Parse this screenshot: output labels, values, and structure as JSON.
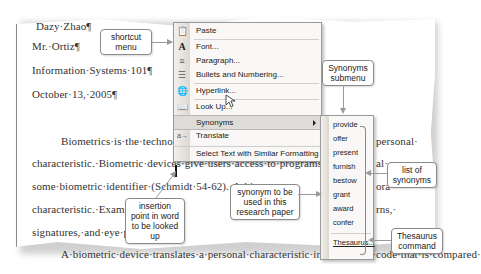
{
  "document": {
    "lines": [
      "Dazy·Zhao¶",
      "Mr.·Ortiz¶",
      "Information·Systems·101¶",
      "October·13,·2005¶",
      "Biometrics·is·the·technology·",
      "characteristic.·Biometric·devices·give·users·access·to·programs,·system",
      "some·biometric·identifier·(Schmidt·54-62).·A·biom",
      "characteristic.·Examples",
      "signatures,·and·eye·patt",
      "A·biometric·device·translates·a·personal·characteristic·into·a·digital·code·that·is·compared·"
    ],
    "right_fragments": [
      "personal·",
      "al·",
      "ora",
      "rns,·"
    ]
  },
  "shortcut_menu": {
    "items": [
      {
        "label": "Paste",
        "icon": "paste-icon"
      },
      {
        "label": "Font...",
        "icon": "font-icon"
      },
      {
        "label": "Paragraph...",
        "icon": "paragraph-icon"
      },
      {
        "label": "Bullets and Numbering...",
        "icon": "bullets-icon"
      },
      {
        "label": "Hyperlink...",
        "icon": "hyperlink-icon"
      },
      {
        "label": "Look Up...",
        "icon": "lookup-icon"
      },
      {
        "label": "Synonyms",
        "icon": "",
        "submenu": true,
        "highlighted": true
      },
      {
        "label": "Translate",
        "icon": "translate-icon"
      },
      {
        "label": "Select Text with Similar Formatting",
        "icon": ""
      }
    ]
  },
  "synonyms_submenu": {
    "items": [
      "provide",
      "offer",
      "present",
      "furnish",
      "bestow",
      "grant",
      "award",
      "confer"
    ],
    "thesaurus_label": "Thesaurus..."
  },
  "callouts": {
    "shortcut_menu": "shortcut menu",
    "synonyms_submenu": "Synonyms submenu",
    "list_of_synonyms": "list of synonyms",
    "synonym_used": "synonym to be used in this research paper",
    "insertion_point": "insertion point in word to be looked up",
    "thesaurus_command": "Thesaurus command"
  }
}
